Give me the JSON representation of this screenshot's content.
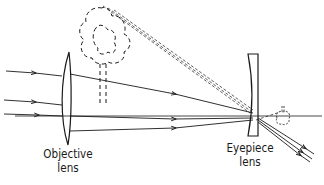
{
  "diagram": {
    "labels": {
      "objective": {
        "line1": "Objective",
        "line2": "lens"
      },
      "eyepiece": {
        "line1": "Eyepiece",
        "line2": "lens"
      }
    },
    "elements": [
      "objective-lens (convex)",
      "eyepiece-lens (concave)",
      "tree (dashed, virtual image)",
      "inverted tree (small, dashed)",
      "optical axis",
      "incoming parallel rays with arrows",
      "dashed construction lines",
      "diverging outgoing rays with arrows"
    ],
    "colors": {
      "stroke": "#1a1a1a",
      "background": "#ffffff"
    }
  }
}
